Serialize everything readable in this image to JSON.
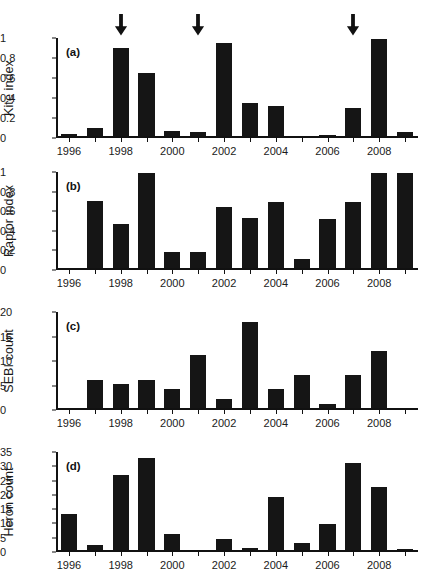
{
  "figure": {
    "panel_letters": [
      "(a)",
      "(b)",
      "(c)",
      "(d)"
    ],
    "x_tick_labels": [
      "1996",
      "1998",
      "2000",
      "2002",
      "2004",
      "2006",
      "2008"
    ],
    "arrow_icon": "down-arrow-icon",
    "bar_color": "#151515",
    "axis_color": "#111111"
  },
  "chart_data": [
    {
      "type": "bar",
      "panel": "(a)",
      "title": "",
      "xlabel": "",
      "ylabel": "Kite index",
      "ylim": [
        0,
        1
      ],
      "yticks": [
        0,
        0.2,
        0.4,
        0.6,
        0.8,
        1
      ],
      "ytick_labels": [
        "0",
        "0.2",
        "0.4",
        "0.6",
        "0.8",
        "1"
      ],
      "xlim": [
        1995.5,
        2009.5
      ],
      "grid": false,
      "categories": [
        1996,
        1997,
        1998,
        1999,
        2000,
        2001,
        2002,
        2003,
        2004,
        2005,
        2006,
        2007,
        2008,
        2009
      ],
      "values": [
        0.02,
        0.09,
        0.9,
        0.64,
        0.06,
        0.04,
        0.95,
        0.34,
        0.31,
        0.0,
        0.01,
        0.29,
        0.99,
        0.05
      ],
      "annotations": [
        {
          "type": "arrow",
          "x": 1998,
          "label": "down-arrow-icon"
        },
        {
          "type": "arrow",
          "x": 2001,
          "label": "down-arrow-icon"
        },
        {
          "type": "arrow",
          "x": 2007,
          "label": "down-arrow-icon"
        }
      ]
    },
    {
      "type": "bar",
      "panel": "(b)",
      "title": "",
      "xlabel": "",
      "ylabel": "Raptor index",
      "ylim": [
        0,
        1
      ],
      "yticks": [
        0,
        0.2,
        0.4,
        0.6,
        0.8,
        1
      ],
      "ytick_labels": [
        "0",
        "0.2",
        "0.4",
        "0.6",
        "0.8",
        "1"
      ],
      "xlim": [
        1995.5,
        2009.5
      ],
      "grid": false,
      "categories": [
        1996,
        1997,
        1998,
        1999,
        2000,
        2001,
        2002,
        2003,
        2004,
        2005,
        2006,
        2007,
        2008,
        2009
      ],
      "values": [
        0.0,
        0.7,
        0.46,
        0.99,
        0.17,
        0.17,
        0.64,
        0.52,
        0.69,
        0.1,
        0.51,
        0.69,
        0.99,
        0.99
      ],
      "annotations": []
    },
    {
      "type": "bar",
      "panel": "(c)",
      "title": "",
      "xlabel": "",
      "ylabel": "SEBI count",
      "ylim": [
        0,
        20
      ],
      "yticks": [
        0,
        5,
        10,
        15,
        20
      ],
      "ytick_labels": [
        "0",
        "5",
        "10",
        "15",
        "20"
      ],
      "xlim": [
        1995.5,
        2009.5
      ],
      "grid": false,
      "categories": [
        1996,
        1997,
        1998,
        1999,
        2000,
        2001,
        2002,
        2003,
        2004,
        2005,
        2006,
        2007,
        2008,
        2009
      ],
      "values": [
        0,
        6,
        5,
        6,
        4,
        11,
        2,
        18,
        4,
        7,
        1,
        7,
        12,
        0
      ],
      "annotations": []
    },
    {
      "type": "bar",
      "panel": "(d)",
      "title": "",
      "xlabel": "",
      "ylabel": "Heron count",
      "ylim": [
        0,
        35
      ],
      "yticks": [
        0,
        5,
        10,
        15,
        20,
        25,
        30,
        35
      ],
      "ytick_labels": [
        "0",
        "5",
        "10",
        "15",
        "20",
        "25",
        "30",
        "35"
      ],
      "xlim": [
        1995.5,
        2009.5
      ],
      "grid": false,
      "categories": [
        1996,
        1997,
        1998,
        1999,
        2000,
        2001,
        2002,
        2003,
        2004,
        2005,
        2006,
        2007,
        2008,
        2009
      ],
      "values": [
        13,
        2,
        27,
        33,
        6,
        0,
        4,
        0.7,
        19,
        2.5,
        9.5,
        31,
        22.5,
        0.5
      ],
      "annotations": []
    }
  ]
}
